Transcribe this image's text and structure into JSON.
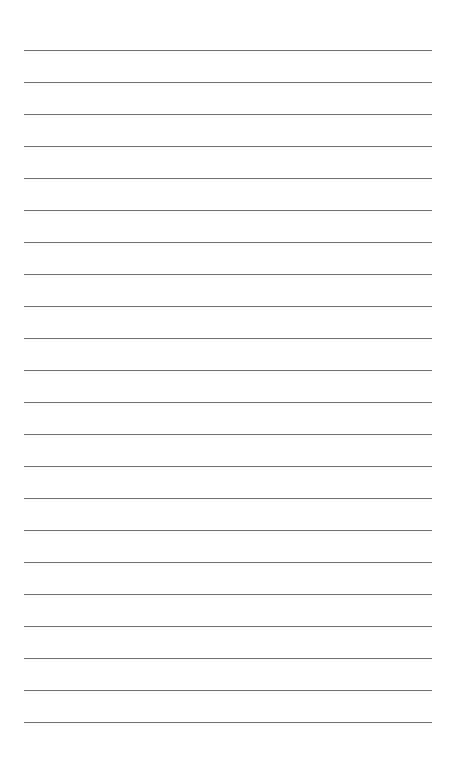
{
  "page": {
    "type": "lined-paper",
    "background_color": "#ffffff",
    "line_color": "#6e6e6e",
    "line_count": 22,
    "first_line_y": 50,
    "line_spacing": 32,
    "line_left": 24,
    "line_width": 408
  }
}
